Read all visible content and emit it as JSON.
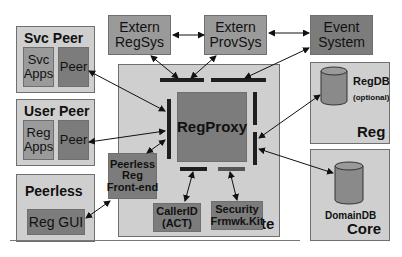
{
  "diagram": {
    "external": {
      "extern_regsys": "Extern\nRegSys",
      "extern_provsys": "Extern\nProvSys",
      "event_system": "Event\nSystem"
    },
    "svc_peer": {
      "title": "Svc Peer",
      "apps": "Svc\nApps",
      "peer": "Peer"
    },
    "user_peer": {
      "title": "User Peer",
      "apps": "Reg\nApps",
      "peer": "Peer"
    },
    "peerless": {
      "title": "Peerless",
      "gui": "Reg GUI"
    },
    "gate": {
      "title": "Gate",
      "regproxy": "RegProxy",
      "frontend": "Peerless\nReg\nFront-end",
      "callerid": "CallerID\n(ACT)",
      "security": "Security\nFrmwk.Kit"
    },
    "reg": {
      "title": "Reg",
      "db": "RegDB",
      "db_note": "(optional)"
    },
    "core": {
      "title": "Core",
      "db": "DomainDB"
    },
    "colors": {
      "light": "#cfcfcf",
      "mid": "#9a9a9a",
      "dark": "#7c7c7c",
      "bar": "#1e1e1e"
    }
  }
}
